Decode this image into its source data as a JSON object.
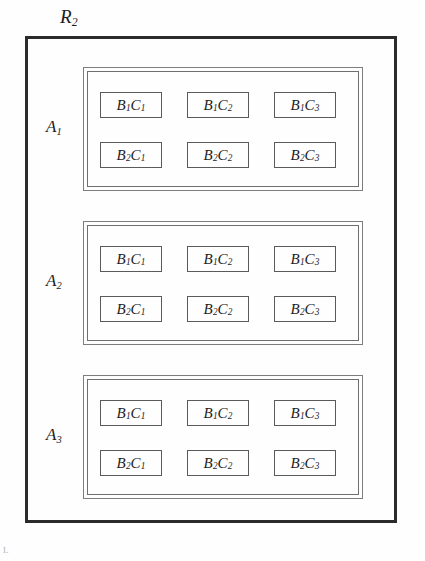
{
  "diagram": {
    "type": "nested-design",
    "outer_region": {
      "label_text": "R",
      "label_sub": "2",
      "border_color": "#2b2b2b"
    },
    "background_color": "#fefefe",
    "groups": [
      {
        "label_text": "A",
        "label_sub": "1",
        "cells": [
          [
            {
              "b_text": "B",
              "b_sub": "1",
              "c_text": "C",
              "c_sub": "1"
            },
            {
              "b_text": "B",
              "b_sub": "1",
              "c_text": "C",
              "c_sub": "2"
            },
            {
              "b_text": "B",
              "b_sub": "1",
              "c_text": "C",
              "c_sub": "3"
            }
          ],
          [
            {
              "b_text": "B",
              "b_sub": "2",
              "c_text": "C",
              "c_sub": "1"
            },
            {
              "b_text": "B",
              "b_sub": "2",
              "c_text": "C",
              "c_sub": "2"
            },
            {
              "b_text": "B",
              "b_sub": "2",
              "c_text": "C",
              "c_sub": "3"
            }
          ]
        ]
      },
      {
        "label_text": "A",
        "label_sub": "2",
        "cells": [
          [
            {
              "b_text": "B",
              "b_sub": "1",
              "c_text": "C",
              "c_sub": "1"
            },
            {
              "b_text": "B",
              "b_sub": "1",
              "c_text": "C",
              "c_sub": "2"
            },
            {
              "b_text": "B",
              "b_sub": "1",
              "c_text": "C",
              "c_sub": "3"
            }
          ],
          [
            {
              "b_text": "B",
              "b_sub": "2",
              "c_text": "C",
              "c_sub": "1"
            },
            {
              "b_text": "B",
              "b_sub": "2",
              "c_text": "C",
              "c_sub": "2"
            },
            {
              "b_text": "B",
              "b_sub": "2",
              "c_text": "C",
              "c_sub": "3"
            }
          ]
        ]
      },
      {
        "label_text": "A",
        "label_sub": "3",
        "cells": [
          [
            {
              "b_text": "B",
              "b_sub": "1",
              "c_text": "C",
              "c_sub": "1"
            },
            {
              "b_text": "B",
              "b_sub": "1",
              "c_text": "C",
              "c_sub": "2"
            },
            {
              "b_text": "B",
              "b_sub": "1",
              "c_text": "C",
              "c_sub": "3"
            }
          ],
          [
            {
              "b_text": "B",
              "b_sub": "2",
              "c_text": "C",
              "c_sub": "1"
            },
            {
              "b_text": "B",
              "b_sub": "2",
              "c_text": "C",
              "c_sub": "2"
            },
            {
              "b_text": "B",
              "b_sub": "2",
              "c_text": "C",
              "c_sub": "3"
            }
          ]
        ]
      }
    ],
    "artifact": {
      "mark": "L"
    }
  }
}
